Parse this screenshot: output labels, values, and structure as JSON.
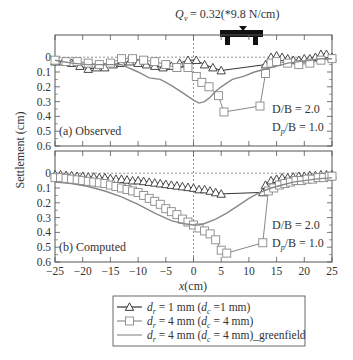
{
  "chart_data": [
    {
      "type": "line",
      "panel": "top",
      "panel_label": "(a) Observed",
      "annotation": [
        "D/B = 2.0",
        "D_p/B = 1.0"
      ],
      "xlim": [
        -25,
        25
      ],
      "ylim": [
        -0.15,
        0.6
      ],
      "yticks": [
        "0",
        "0.1",
        "0.2",
        "0.3",
        "0.4",
        "0.5",
        "0.6"
      ],
      "series": [
        {
          "name": "d_r = 1 mm (d_c = 1 mm)",
          "marker": "triangle",
          "color": "#333333",
          "x": [
            -25,
            -23.5,
            -22,
            -20.5,
            -19,
            -17.5,
            -16,
            -14.5,
            -13,
            -11.5,
            -10,
            -8.5,
            -7,
            -5.5,
            -4,
            -2.5,
            -1,
            0.5,
            2,
            3.5,
            5,
            13,
            14,
            15,
            16,
            17,
            18,
            19,
            20,
            21,
            22,
            23,
            24,
            25
          ],
          "y": [
            0.03,
            0.03,
            0.04,
            0.06,
            0.08,
            0.07,
            0.07,
            0.05,
            0.04,
            0.03,
            0.04,
            0.05,
            0.06,
            0.07,
            0.06,
            0.04,
            0.02,
            0.02,
            0.05,
            0.07,
            0.09,
            0.05,
            0.0,
            -0.01,
            0.0,
            0.01,
            0.02,
            0.02,
            0.01,
            0.01,
            0.0,
            -0.02,
            -0.02,
            0.0
          ]
        },
        {
          "name": "d_r = 4 mm (d_c = 4 mm)",
          "marker": "square",
          "color": "#888888",
          "x": [
            -25,
            -23,
            -21,
            -19,
            -17,
            -15,
            -13,
            -11,
            -9,
            -7,
            -5,
            -3,
            -1,
            0.5,
            1.5,
            2.8,
            4.5,
            5.5,
            12,
            13,
            14,
            15,
            17,
            19,
            21,
            23,
            25
          ],
          "y": [
            0.02,
            0.03,
            0.03,
            0.04,
            0.05,
            0.04,
            0.01,
            0.01,
            0.02,
            0.03,
            0.05,
            0.07,
            0.07,
            0.13,
            0.17,
            0.2,
            0.26,
            0.37,
            0.33,
            0.11,
            0.04,
            0.03,
            0.04,
            0.05,
            0.04,
            0.02,
            0.01
          ]
        },
        {
          "name": "d_r = 4 mm (d_c = 4 mm)_greenfield",
          "marker": "none",
          "color": "#888888",
          "x": [
            -25,
            -22,
            -19,
            -16,
            -13,
            -10,
            -8,
            -6,
            -4,
            -2,
            0,
            1,
            2,
            3,
            4,
            5,
            7,
            9,
            11,
            13,
            15,
            17,
            19,
            21,
            23,
            25
          ],
          "y": [
            0.02,
            0.04,
            0.05,
            0.05,
            0.05,
            0.1,
            0.14,
            0.15,
            0.19,
            0.24,
            0.29,
            0.31,
            0.3,
            0.27,
            0.23,
            0.2,
            0.15,
            0.13,
            0.1,
            0.08,
            0.06,
            0.04,
            0.03,
            0.02,
            0.01,
            0.01
          ]
        }
      ]
    },
    {
      "type": "line",
      "panel": "bottom",
      "panel_label": "(b) Computed",
      "annotation": [
        "D/B = 2.0",
        "D_p/B = 1.0"
      ],
      "xlim": [
        -25,
        25
      ],
      "ylim": [
        -0.15,
        0.6
      ],
      "xticks": [
        "−25",
        "−20",
        "−15",
        "−10",
        "−5",
        "0",
        "5",
        "10",
        "15",
        "20",
        "25"
      ],
      "yticks": [
        "0",
        "0.1",
        "0.2",
        "0.3",
        "0.4",
        "0.5",
        "0.6"
      ],
      "xlabel": "x(cm)",
      "ylabel": "Settlement (cm)",
      "series": [
        {
          "name": "d_r = 1 mm (d_c = 1 mm)",
          "marker": "triangle",
          "color": "#333333",
          "x": [
            -25,
            -24,
            -23,
            -22,
            -21,
            -20,
            -19,
            -18,
            -17,
            -16,
            -15,
            -14,
            -13,
            -12,
            -11,
            -10,
            -9,
            -8,
            -7,
            -6,
            -5,
            -4,
            -3,
            -2,
            -1,
            0,
            1,
            2,
            3,
            4,
            5,
            12.5,
            13,
            14,
            15,
            16,
            17,
            18,
            19,
            20,
            21,
            22,
            23,
            24,
            25
          ],
          "y": [
            0.01,
            0.01,
            0.015,
            0.015,
            0.02,
            0.02,
            0.025,
            0.025,
            0.03,
            0.03,
            0.035,
            0.04,
            0.04,
            0.045,
            0.05,
            0.05,
            0.055,
            0.06,
            0.065,
            0.07,
            0.075,
            0.08,
            0.085,
            0.09,
            0.095,
            0.1,
            0.11,
            0.11,
            0.12,
            0.13,
            0.14,
            0.13,
            0.08,
            0.05,
            0.04,
            0.03,
            0.03,
            0.025,
            0.02,
            0.02,
            0.015,
            0.015,
            0.01,
            0.01,
            0.01
          ]
        },
        {
          "name": "d_r = 4 mm (d_c = 4 mm)",
          "marker": "square",
          "color": "#888888",
          "x": [
            -25,
            -24,
            -23,
            -22,
            -21,
            -20,
            -19,
            -18,
            -17,
            -16,
            -15,
            -14,
            -13,
            -12,
            -11,
            -10,
            -9,
            -8,
            -7,
            -6,
            -5,
            -4,
            -3,
            -2,
            -1,
            0,
            1,
            2,
            3,
            4,
            5,
            6,
            12.5,
            13.5,
            14.5,
            15.5,
            16.5,
            17.5,
            18.5,
            19.5,
            20.5,
            21.5,
            22.5,
            23.5,
            24.5,
            25
          ],
          "y": [
            0.03,
            0.03,
            0.035,
            0.04,
            0.045,
            0.05,
            0.055,
            0.06,
            0.065,
            0.07,
            0.08,
            0.09,
            0.1,
            0.11,
            0.12,
            0.13,
            0.15,
            0.17,
            0.19,
            0.21,
            0.24,
            0.26,
            0.28,
            0.31,
            0.33,
            0.35,
            0.37,
            0.39,
            0.41,
            0.45,
            0.52,
            0.54,
            0.47,
            0.12,
            0.1,
            0.08,
            0.07,
            0.06,
            0.05,
            0.05,
            0.04,
            0.04,
            0.03,
            0.03,
            0.02,
            0.02
          ]
        },
        {
          "name": "d_r = 4 mm (d_c = 4 mm)_greenfield",
          "marker": "none",
          "color": "#888888",
          "x": [
            -25,
            -22,
            -19,
            -16,
            -13,
            -10,
            -7,
            -4,
            -2,
            0,
            1,
            2,
            4,
            6,
            8,
            10,
            12,
            14,
            16,
            18,
            20,
            22,
            25
          ],
          "y": [
            0.06,
            0.07,
            0.09,
            0.12,
            0.16,
            0.21,
            0.27,
            0.32,
            0.34,
            0.35,
            0.35,
            0.34,
            0.31,
            0.27,
            0.22,
            0.17,
            0.13,
            0.1,
            0.08,
            0.06,
            0.05,
            0.04,
            0.03
          ]
        }
      ]
    }
  ],
  "load_label": "Q_v = 0.32(*9.8 N/cm)",
  "legend": [
    {
      "text_main": "d",
      "sub": "r",
      "text_rest": " = 1 mm (",
      "sub2_base": "d",
      "sub2": "c",
      "text_tail": " =1 mm)"
    },
    {
      "text_main": "d",
      "sub": "r",
      "text_rest": " = 4 mm (",
      "sub2_base": "d",
      "sub2": "c",
      "text_tail": " = 4 mm)"
    },
    {
      "text_main": "d",
      "sub": "r",
      "text_rest": " = 4 mm (",
      "sub2_base": "d",
      "sub2": "c",
      "text_tail": " = 4 mm)_greenfield"
    }
  ]
}
